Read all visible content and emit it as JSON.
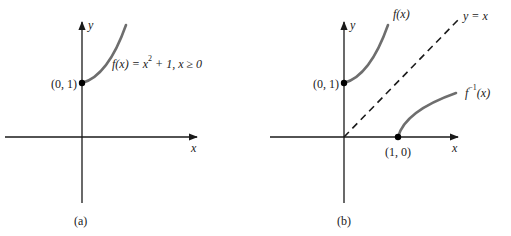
{
  "panels": [
    {
      "id": "a",
      "caption": "(a)",
      "x_label": "x",
      "y_label": "y",
      "point_label": "(0, 1)",
      "curve_label": {
        "prefix": "f(x) = x",
        "exp": "2",
        "suffix": " + 1, x ≥ 0"
      }
    },
    {
      "id": "b",
      "caption": "(b)",
      "x_label": "x",
      "y_label": "y",
      "point1_label": "(0, 1)",
      "point2_label": "(1, 0)",
      "f_label": "f(x)",
      "line_label": "y = x",
      "finv_label": {
        "base": "f",
        "exp": "−1",
        "arg": "(x)"
      }
    }
  ],
  "colors": {
    "axis": "#1a1a1a",
    "curve": "#6e6e6e",
    "dashed": "#1a1a1a",
    "point": "#000000"
  }
}
